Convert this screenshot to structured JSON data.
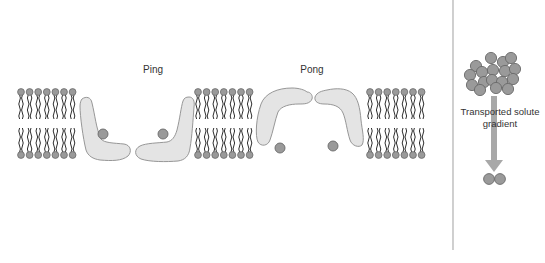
{
  "diagram": {
    "labels": {
      "ping": "Ping",
      "pong": "Pong",
      "gradient_line1": "Transported solute",
      "gradient_line2": "gradient"
    },
    "colors": {
      "background": "#ffffff",
      "lipid_head_fill": "#9a9a9a",
      "lipid_head_stroke": "#6b6b6b",
      "lipid_tail": "#2e2e2e",
      "transporter_fill": "#e4e4e4",
      "transporter_stroke": "#8c8c8c",
      "solute_fill": "#9a9a9a",
      "solute_stroke": "#6a6a6a",
      "arrow": "#a8a8a8",
      "divider": "#b0b0b0",
      "text": "#333333"
    },
    "membrane_segments": [
      {
        "name": "left",
        "x_start": 21,
        "count": 7,
        "spacing": 8.6
      },
      {
        "name": "middle",
        "x_start": 198,
        "count": 7,
        "spacing": 8.6
      },
      {
        "name": "right",
        "x_start": 370,
        "count": 7,
        "spacing": 8.6
      }
    ],
    "membrane_geometry": {
      "top_head_y": 92,
      "bottom_head_y": 155,
      "head_radius": 3.4,
      "tail_length": 24
    },
    "transporters": {
      "ping": [
        "left-arm",
        "right-arm"
      ],
      "pong": [
        "left-arm",
        "right-arm"
      ]
    },
    "solutes": {
      "ping": [
        {
          "cx": 103,
          "cy": 134
        },
        {
          "cx": 163,
          "cy": 134
        }
      ],
      "pong": [
        {
          "cx": 280,
          "cy": 148
        },
        {
          "cx": 333,
          "cy": 146
        }
      ]
    },
    "gradient_panel": {
      "high_cluster": [
        {
          "cx": 476,
          "cy": 66
        },
        {
          "cx": 491,
          "cy": 58
        },
        {
          "cx": 503,
          "cy": 62
        },
        {
          "cx": 511,
          "cy": 58
        },
        {
          "cx": 470,
          "cy": 75
        },
        {
          "cx": 482,
          "cy": 72
        },
        {
          "cx": 493,
          "cy": 70
        },
        {
          "cx": 505,
          "cy": 71
        },
        {
          "cx": 515,
          "cy": 69
        },
        {
          "cx": 472,
          "cy": 85
        },
        {
          "cx": 484,
          "cy": 82
        },
        {
          "cx": 492,
          "cy": 80
        },
        {
          "cx": 502,
          "cy": 82
        },
        {
          "cx": 513,
          "cy": 79
        },
        {
          "cx": 480,
          "cy": 90
        },
        {
          "cx": 496,
          "cy": 88
        },
        {
          "cx": 508,
          "cy": 89
        }
      ],
      "low_cluster": [
        {
          "cx": 489,
          "cy": 179
        },
        {
          "cx": 500,
          "cy": 179
        }
      ],
      "arrow": {
        "x": 494,
        "y_start": 96,
        "y_end": 172
      }
    },
    "divider_x": 453
  }
}
